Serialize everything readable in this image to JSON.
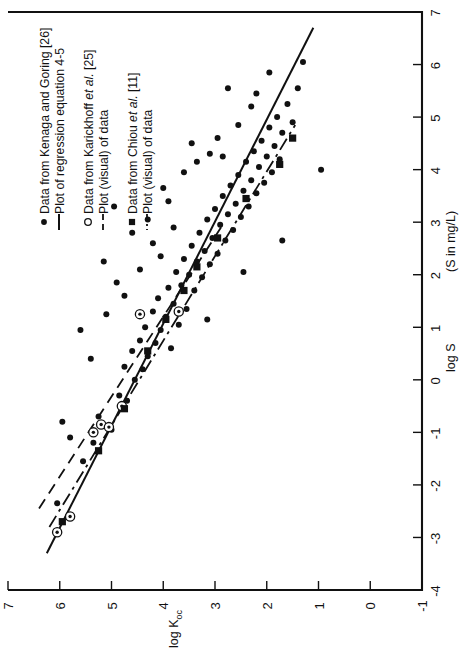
{
  "chart_data": {
    "type": "scatter",
    "title": "",
    "orientation": "rotated-90-clockwise",
    "xlabel": "log K_oc",
    "xlabel_text": "log K",
    "xlabel_sub": "oc",
    "ylabel": "log S",
    "ylabel_units": "(S in mg/L)",
    "xlim": [
      -1,
      7
    ],
    "ylim": [
      -4,
      7
    ],
    "xticks": [
      -1,
      0,
      1,
      2,
      3,
      4,
      5,
      6,
      7
    ],
    "yticks": [
      -4,
      -3,
      -2,
      -1,
      0,
      1,
      2,
      3,
      4,
      5,
      6,
      7
    ],
    "grid": false,
    "legend_position": "top-left",
    "series": [
      {
        "name": "Data from Kenaga and Goring [26]",
        "marker": "filled-circle",
        "points": [
          [
            6.05,
            -2.35
          ],
          [
            5.55,
            -1.55
          ],
          [
            5.35,
            -1.2
          ],
          [
            5.25,
            -0.7
          ],
          [
            5.0,
            -0.95
          ],
          [
            4.85,
            -0.3
          ],
          [
            4.75,
            0.25
          ],
          [
            4.7,
            -0.4
          ],
          [
            4.6,
            0.55
          ],
          [
            4.55,
            0.0
          ],
          [
            4.45,
            0.75
          ],
          [
            4.4,
            0.2
          ],
          [
            4.35,
            1.0
          ],
          [
            4.3,
            0.45
          ],
          [
            4.2,
            1.3
          ],
          [
            4.15,
            0.7
          ],
          [
            4.1,
            1.55
          ],
          [
            4.05,
            0.95
          ],
          [
            3.95,
            1.2
          ],
          [
            3.9,
            1.75
          ],
          [
            3.85,
            0.6
          ],
          [
            3.8,
            1.45
          ],
          [
            3.75,
            2.05
          ],
          [
            3.7,
            1.05
          ],
          [
            3.65,
            1.8
          ],
          [
            3.6,
            2.3
          ],
          [
            3.55,
            1.35
          ],
          [
            3.5,
            2.0
          ],
          [
            3.45,
            2.55
          ],
          [
            3.4,
            1.7
          ],
          [
            3.35,
            2.25
          ],
          [
            3.3,
            2.8
          ],
          [
            3.25,
            1.95
          ],
          [
            3.2,
            2.45
          ],
          [
            3.15,
            3.05
          ],
          [
            3.1,
            2.2
          ],
          [
            3.05,
            2.7
          ],
          [
            3.0,
            3.25
          ],
          [
            2.95,
            2.4
          ],
          [
            2.9,
            2.95
          ],
          [
            2.85,
            3.5
          ],
          [
            2.8,
            2.65
          ],
          [
            2.75,
            3.15
          ],
          [
            2.7,
            3.7
          ],
          [
            2.65,
            2.85
          ],
          [
            2.6,
            3.35
          ],
          [
            2.55,
            3.9
          ],
          [
            2.5,
            3.1
          ],
          [
            2.45,
            3.6
          ],
          [
            2.4,
            4.15
          ],
          [
            2.35,
            3.3
          ],
          [
            2.3,
            3.8
          ],
          [
            2.25,
            4.35
          ],
          [
            2.2,
            3.55
          ],
          [
            2.15,
            4.05
          ],
          [
            2.1,
            4.55
          ],
          [
            2.05,
            3.75
          ],
          [
            2.0,
            4.25
          ],
          [
            1.95,
            4.8
          ],
          [
            1.9,
            3.95
          ],
          [
            1.85,
            4.45
          ],
          [
            1.8,
            5.0
          ],
          [
            1.75,
            4.2
          ],
          [
            1.7,
            4.7
          ],
          [
            1.6,
            5.25
          ],
          [
            1.5,
            4.9
          ],
          [
            1.4,
            5.55
          ],
          [
            1.3,
            6.05
          ],
          [
            3.9,
            3.4
          ],
          [
            3.6,
            3.95
          ],
          [
            3.1,
            4.3
          ],
          [
            2.95,
            4.6
          ],
          [
            2.55,
            4.85
          ],
          [
            2.3,
            5.2
          ],
          [
            4.2,
            2.6
          ],
          [
            4.45,
            2.1
          ],
          [
            4.75,
            1.6
          ],
          [
            5.1,
            1.25
          ],
          [
            5.4,
            0.4
          ],
          [
            2.75,
            5.55
          ],
          [
            3.35,
            4.15
          ],
          [
            3.8,
            2.9
          ],
          [
            4.05,
            2.35
          ],
          [
            2.2,
            5.45
          ],
          [
            1.95,
            5.85
          ],
          [
            0.95,
            4.0
          ],
          [
            5.95,
            -0.8
          ],
          [
            5.8,
            -1.1
          ],
          [
            4.95,
            3.3
          ],
          [
            4.3,
            3.05
          ],
          [
            3.45,
            4.5
          ],
          [
            2.85,
            4.25
          ],
          [
            5.15,
            2.25
          ],
          [
            4.6,
            2.8
          ],
          [
            3.15,
            1.15
          ],
          [
            2.45,
            2.05
          ],
          [
            1.7,
            2.65
          ],
          [
            5.6,
            0.95
          ],
          [
            4.9,
            1.85
          ],
          [
            4.0,
            3.65
          ]
        ]
      },
      {
        "name": "Data from Karickhoff et al. [25]",
        "marker": "open-circle-dot",
        "points": [
          [
            6.05,
            -2.9
          ],
          [
            5.8,
            -2.6
          ],
          [
            5.35,
            -1.0
          ],
          [
            5.2,
            -0.85
          ],
          [
            5.05,
            -0.9
          ],
          [
            4.8,
            -0.5
          ],
          [
            4.45,
            1.25
          ],
          [
            3.7,
            1.3
          ]
        ]
      },
      {
        "name": "Data from Chiou et al. [11]",
        "marker": "filled-square",
        "points": [
          [
            5.95,
            -2.7
          ],
          [
            5.25,
            -1.35
          ],
          [
            4.75,
            -0.55
          ],
          [
            4.3,
            0.55
          ],
          [
            3.95,
            1.15
          ],
          [
            3.6,
            1.7
          ],
          [
            3.35,
            2.15
          ],
          [
            2.95,
            2.7
          ],
          [
            2.4,
            3.45
          ],
          [
            1.75,
            4.1
          ],
          [
            1.5,
            4.6
          ]
        ]
      }
    ],
    "lines": [
      {
        "name": "Plot of regression equation 4-5",
        "style": "solid",
        "source": "Kenaga and Goring [26]",
        "endpoints": [
          [
            6.25,
            -3.3
          ],
          [
            1.1,
            6.7
          ]
        ]
      },
      {
        "name": "Plot (visual) of data",
        "style": "dashed",
        "source": "Karickhoff et al. [25]",
        "endpoints": [
          [
            6.4,
            -2.45
          ],
          [
            2.85,
            2.95
          ]
        ]
      },
      {
        "name": "Plot (visual) of data",
        "style": "dash-dot",
        "source": "Chiou et al. [11]",
        "endpoints": [
          [
            6.2,
            -2.8
          ],
          [
            1.45,
            4.85
          ]
        ]
      }
    ]
  },
  "axes": {
    "x": {
      "label_main": "log K",
      "label_sub": "oc",
      "ticks": [
        "7",
        "6",
        "5",
        "4",
        "3",
        "2",
        "1",
        "0",
        "-1"
      ]
    },
    "y": {
      "label_main": "log S",
      "label_units": "(S in mg/L)",
      "ticks": [
        "7",
        "6",
        "5",
        "4",
        "3",
        "2",
        "1",
        "0",
        "-1",
        "-2",
        "-3",
        "-4"
      ]
    }
  },
  "legend": {
    "groups": [
      {
        "marker": "filled-circle",
        "marker_label": "Data from Kenaga and Goring [26]",
        "marker_text_parts": [
          "Data from Kenaga and Goring [26]"
        ],
        "line_style": "solid",
        "line_label": "Plot of regression equation 4-5"
      },
      {
        "marker": "open-circle",
        "marker_label": "Data from Karickhoff et al. [25]",
        "marker_text_pre": "Data from Karickhoff ",
        "marker_text_ital": "et al.",
        "marker_text_post": " [25]",
        "line_style": "dashed",
        "line_label": "Plot (visual) of data"
      },
      {
        "marker": "filled-square",
        "marker_label": "Data from Chiou et al. [11]",
        "marker_text_pre": "Data from Chiou ",
        "marker_text_ital": "et al.",
        "marker_text_post": " [11]",
        "line_style": "dash-dot",
        "line_label": "Plot (visual) of data"
      }
    ]
  },
  "colors": {
    "ink": "#111111",
    "paper": "#ffffff"
  }
}
